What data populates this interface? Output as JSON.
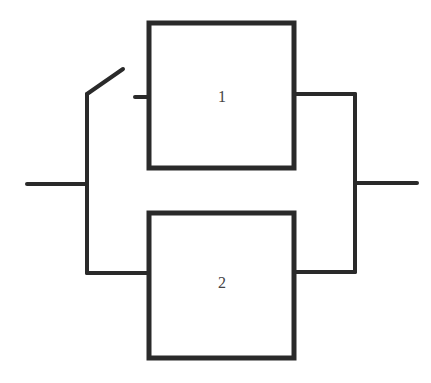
{
  "diagram": {
    "type": "reliability-block-diagram",
    "colors": {
      "line": "#2a2a2a",
      "label": "#444444",
      "background": "#ffffff"
    },
    "blocks": [
      {
        "id": "block-1",
        "label": "1"
      },
      {
        "id": "block-2",
        "label": "2"
      }
    ],
    "switch": {
      "state": "open",
      "position": "before block 1"
    }
  }
}
